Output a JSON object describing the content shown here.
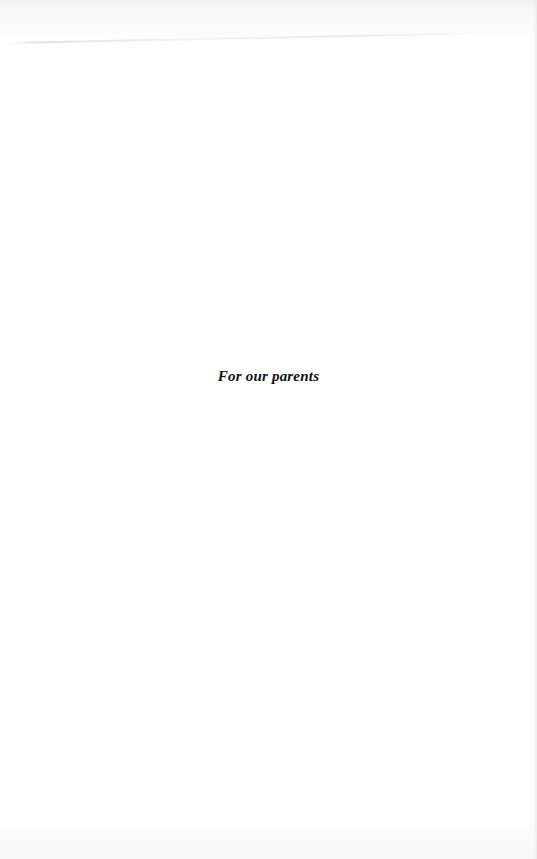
{
  "page": {
    "dedication": "For our parents"
  }
}
